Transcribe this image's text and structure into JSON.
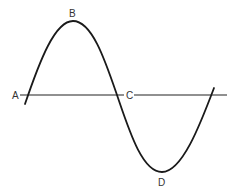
{
  "diagram": {
    "type": "sine-wave",
    "stroke_color": "#1a1a1a",
    "axis_color": "#222222",
    "labels": {
      "A": "A",
      "B": "B",
      "C": "C",
      "D": "D"
    },
    "points": {
      "A": {
        "role": "start zero-crossing"
      },
      "B": {
        "role": "positive peak"
      },
      "C": {
        "role": "middle zero-crossing"
      },
      "D": {
        "role": "negative trough"
      }
    }
  }
}
